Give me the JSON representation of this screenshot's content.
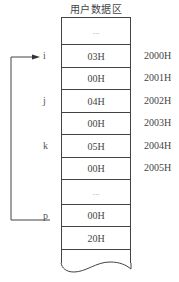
{
  "diagram": {
    "title": "用户数据区",
    "cells": [
      {
        "value": "...",
        "address": "",
        "pointer": "",
        "height": 27
      },
      {
        "value": "03H",
        "address": "2000H",
        "pointer": "i",
        "height": 23
      },
      {
        "value": "00H",
        "address": "2001H",
        "pointer": "",
        "height": 22
      },
      {
        "value": "04H",
        "address": "2002H",
        "pointer": "j",
        "height": 23
      },
      {
        "value": "00H",
        "address": "2003H",
        "pointer": "",
        "height": 22
      },
      {
        "value": "05H",
        "address": "2004H",
        "pointer": "k",
        "height": 23
      },
      {
        "value": "00H",
        "address": "2005H",
        "pointer": "",
        "height": 22
      },
      {
        "value": "...",
        "address": "",
        "pointer": "",
        "height": 25
      },
      {
        "value": "00H",
        "address": "",
        "pointer": "p",
        "height": 22
      },
      {
        "value": "20H",
        "address": "",
        "pointer": "",
        "height": 23
      },
      {
        "value": "",
        "address": "",
        "pointer": "",
        "height": 14
      }
    ],
    "loop_arrow": {
      "from": "p",
      "to": "i",
      "color": "#333333"
    },
    "line_color": "#444444"
  }
}
